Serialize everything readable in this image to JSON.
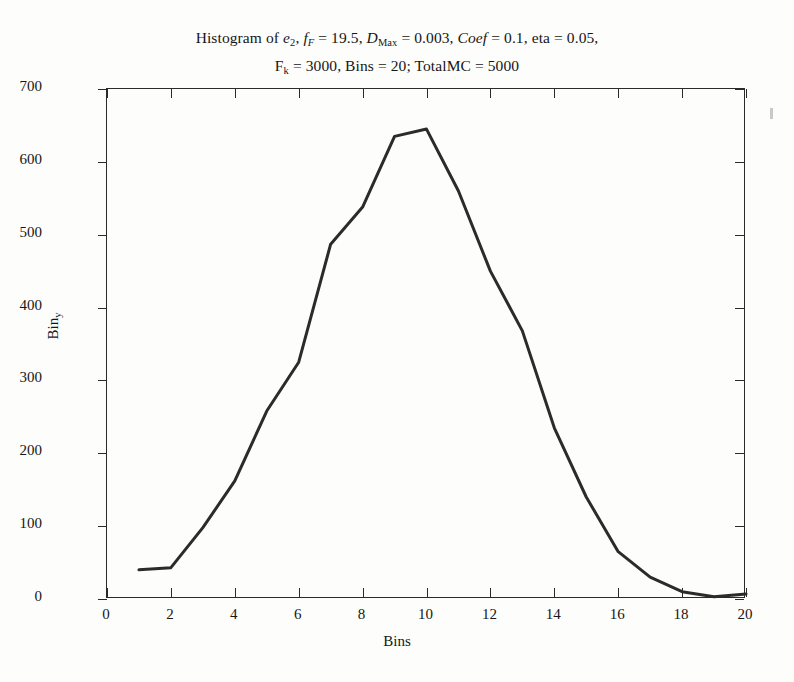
{
  "figure": {
    "title_line1_parts": {
      "a": "Histogram of ",
      "e": "e",
      "e_sub": "2",
      "comma1": ", ",
      "f": "f",
      "f_sub": "F",
      "eq1": " = 19.5, ",
      "D": "D",
      "D_sub": "Max",
      "eq2": " = 0.003, ",
      "Coef": "Coef",
      "eq3": " = 0.1, eta = 0.05,"
    },
    "title_line2_parts": {
      "F": "F",
      "F_sub": "k",
      "rest": " = 3000, Bins = 20; TotalMC = 5000"
    },
    "title_plain": "Histogram of e2, fF = 19.5, DMax = 0.003, Coef = 0.1, eta = 0.05, Fk = 3000, Bins = 20; TotalMC = 5000",
    "xaxis_title": "Bins",
    "yaxis_title_parts": {
      "main": "Bin",
      "sub": "y"
    },
    "yaxis_title_plain": "Biny",
    "line_color": "#2b2b2b",
    "axis_color": "#2a2a2a",
    "background": "#fdfdfb"
  },
  "chart_data": {
    "type": "line",
    "title": "Histogram of e2, fF = 19.5, DMax = 0.003, Coef = 0.1, eta = 0.05, Fk = 3000, Bins = 20; TotalMC = 5000",
    "xlabel": "Bins",
    "ylabel": "Biny",
    "xlim": [
      0,
      20
    ],
    "ylim": [
      0,
      700
    ],
    "xticks": [
      0,
      2,
      4,
      6,
      8,
      10,
      12,
      14,
      16,
      18,
      20
    ],
    "yticks": [
      0,
      100,
      200,
      300,
      400,
      500,
      600,
      700
    ],
    "xtick_labels": [
      "0",
      "2",
      "4",
      "6",
      "8",
      "10",
      "12",
      "14",
      "16",
      "18",
      "20"
    ],
    "ytick_labels": [
      "0",
      "100",
      "200",
      "300",
      "400",
      "500",
      "600",
      "700"
    ],
    "grid": false,
    "legend": null,
    "x": [
      1,
      2,
      3,
      4,
      5,
      6,
      7,
      8,
      9,
      10,
      11,
      12,
      13,
      14,
      15,
      16,
      17,
      18,
      19,
      20
    ],
    "values": [
      40,
      43,
      98,
      162,
      258,
      325,
      487,
      538,
      635,
      645,
      560,
      450,
      368,
      235,
      140,
      65,
      30,
      10,
      3,
      7
    ],
    "series": [
      {
        "name": "Biny",
        "values": [
          40,
          43,
          98,
          162,
          258,
          325,
          487,
          538,
          635,
          645,
          560,
          450,
          368,
          235,
          140,
          65,
          30,
          10,
          3,
          7
        ]
      }
    ],
    "annotations": []
  }
}
